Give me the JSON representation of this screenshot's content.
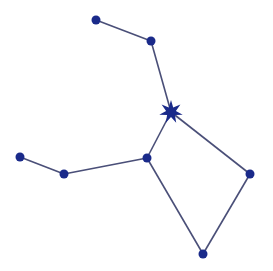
{
  "diagram": {
    "type": "constellation",
    "colors": {
      "line": "#4a4f78",
      "node": "#1a2a8a",
      "star": "#1a2a8a",
      "background": "#ffffff"
    },
    "nodes": [
      {
        "id": "n1",
        "x": 96,
        "y": 20,
        "kind": "dot"
      },
      {
        "id": "n2",
        "x": 151,
        "y": 41,
        "kind": "dot"
      },
      {
        "id": "star",
        "x": 171,
        "y": 112,
        "kind": "star"
      },
      {
        "id": "n4",
        "x": 147,
        "y": 158,
        "kind": "dot"
      },
      {
        "id": "n5",
        "x": 250,
        "y": 174,
        "kind": "dot"
      },
      {
        "id": "n6",
        "x": 203,
        "y": 254,
        "kind": "dot"
      },
      {
        "id": "n7",
        "x": 64,
        "y": 174,
        "kind": "dot"
      },
      {
        "id": "n8",
        "x": 20,
        "y": 157,
        "kind": "dot"
      }
    ],
    "edges": [
      [
        "n1",
        "n2"
      ],
      [
        "n2",
        "star"
      ],
      [
        "star",
        "n4"
      ],
      [
        "star",
        "n5"
      ],
      [
        "n5",
        "n6"
      ],
      [
        "n6",
        "n4"
      ],
      [
        "n4",
        "n7"
      ],
      [
        "n7",
        "n8"
      ]
    ]
  }
}
